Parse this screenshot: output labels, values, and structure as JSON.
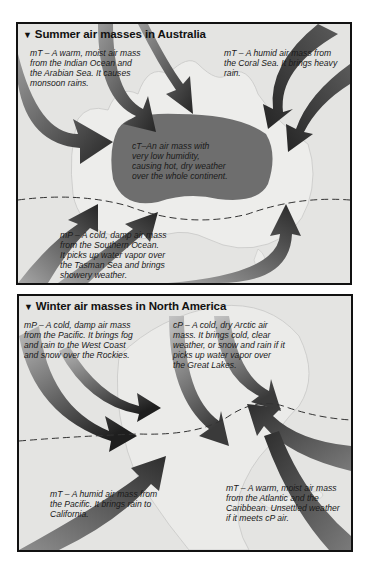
{
  "panels": [
    {
      "title": "Summer air masses in Australia",
      "title_marker": "▼",
      "labels": [
        {
          "id": "au-mT-indian",
          "lines": [
            "mT – A warm, moist air mass",
            "from the Indian Ocean and",
            "the Arabian Sea. It causes",
            "monsoon rains."
          ]
        },
        {
          "id": "au-mT-coral",
          "lines": [
            "mT – A humid air mass from",
            "the Coral Sea. It brings heavy",
            "rain."
          ]
        },
        {
          "id": "au-cT",
          "lines": [
            "cT–An air mass with",
            "very low humidity,",
            "causing hot, dry weather",
            "over the whole continent."
          ]
        },
        {
          "id": "au-mP",
          "lines": [
            "mP – A cold, damp air mass",
            "from the Southern Ocean.",
            "It picks up water vapor over",
            "the Tasman Sea and brings",
            "showery weather."
          ]
        }
      ]
    },
    {
      "title": "Winter air masses in North America",
      "title_marker": "▼",
      "labels": [
        {
          "id": "na-mP",
          "lines": [
            "mP – A cold, damp air mass",
            "from the Pacific. It brings fog",
            "and rain to the West Coast",
            "and snow over the Rockies."
          ]
        },
        {
          "id": "na-cP",
          "lines": [
            "cP – A cold, dry Arctic air",
            "mass. It brings cold, clear",
            "weather, or snow and rain if it",
            "picks up water vapor over",
            "the Great Lakes."
          ]
        },
        {
          "id": "na-mT-pacific",
          "lines": [
            "mT – A humid air mass from",
            "the Pacific. It brings rain to",
            "California."
          ]
        },
        {
          "id": "na-mT-atlantic",
          "lines": [
            "mT – A warm, moist air mass",
            "from the Atlantic and the",
            "Caribbean. Unsettled weather",
            "if it meets cP air."
          ]
        }
      ]
    }
  ],
  "colors": {
    "background": "#e4e4e2",
    "land": "#ededeb",
    "continental_blob": "#6e6e6e",
    "arrow_dark": "#2a2a2a",
    "arrow_light": "#b0b0b0",
    "border": "#111111"
  }
}
